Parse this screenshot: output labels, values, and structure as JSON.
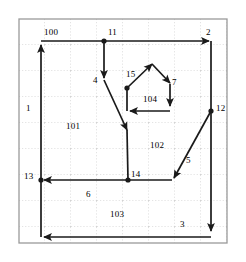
{
  "figure": {
    "type": "flow-network-diagram",
    "background": "#ffffff",
    "stroke_color": "#1a1a1a",
    "grid_color": "#b9b9b9",
    "border_color": "#9a9a9a",
    "frame": {
      "left": 19,
      "top": 19,
      "right": 227,
      "bottom": 243
    },
    "grid": {
      "cell_px": 26,
      "style": "dotted",
      "cols": 8,
      "rows": 8
    }
  },
  "nodes": [
    {
      "id": "11",
      "label": "11",
      "x": 104,
      "y": 41,
      "label_x": 108,
      "label_y": 28
    },
    {
      "id": "2",
      "label": "2",
      "x": 211,
      "y": 41,
      "label_x": 206,
      "label_y": 28
    },
    {
      "id": "12",
      "label": "12",
      "x": 211,
      "y": 111,
      "label_x": 216,
      "label_y": 104
    },
    {
      "id": "13",
      "label": "13",
      "x": 41,
      "y": 180,
      "label_x": 24,
      "label_y": 172
    },
    {
      "id": "14",
      "label": "14",
      "x": 128,
      "y": 180,
      "label_x": 131,
      "label_y": 170
    },
    {
      "id": "15",
      "label": "15",
      "x": 127,
      "y": 88,
      "label_x": 126,
      "label_y": 70
    }
  ],
  "edges": [
    {
      "id": "1",
      "label": "1",
      "label_x": 26,
      "label_y": 104,
      "direction": "up",
      "description": "left boundary, upward"
    },
    {
      "id": "100",
      "label": "100",
      "label_x": 44,
      "label_y": 28,
      "direction": "right",
      "description": "top boundary, rightward"
    },
    {
      "id": "2",
      "label": "2",
      "label_x": 206,
      "label_y": 28,
      "direction": "right",
      "description": "arrives top-right corner"
    },
    {
      "id": "3",
      "label": "3",
      "label_x": 180,
      "label_y": 220,
      "direction": "left",
      "description": "bottom boundary, leftward"
    },
    {
      "id": "4",
      "label": "4",
      "label_x": 93,
      "label_y": 76,
      "direction": "down",
      "description": "from node 11 down then diagonal to node 14"
    },
    {
      "id": "5",
      "label": "5",
      "label_x": 186,
      "label_y": 156,
      "direction": "down-left",
      "description": "from node 12 diagonally to node 14 line"
    },
    {
      "id": "6",
      "label": "6",
      "label_x": 86,
      "label_y": 190,
      "direction": "left",
      "description": "horizontal into node 13"
    },
    {
      "id": "7",
      "label": "7",
      "label_x": 172,
      "label_y": 78,
      "direction": "down",
      "description": "pentagon right flank"
    }
  ],
  "regions": [
    {
      "id": "101",
      "label": "101",
      "label_x": 66,
      "label_y": 122
    },
    {
      "id": "102",
      "label": "102",
      "label_x": 150,
      "label_y": 141
    },
    {
      "id": "103",
      "label": "103",
      "label_x": 110,
      "label_y": 210
    },
    {
      "id": "104",
      "label": "104",
      "label_x": 143,
      "label_y": 95
    }
  ]
}
